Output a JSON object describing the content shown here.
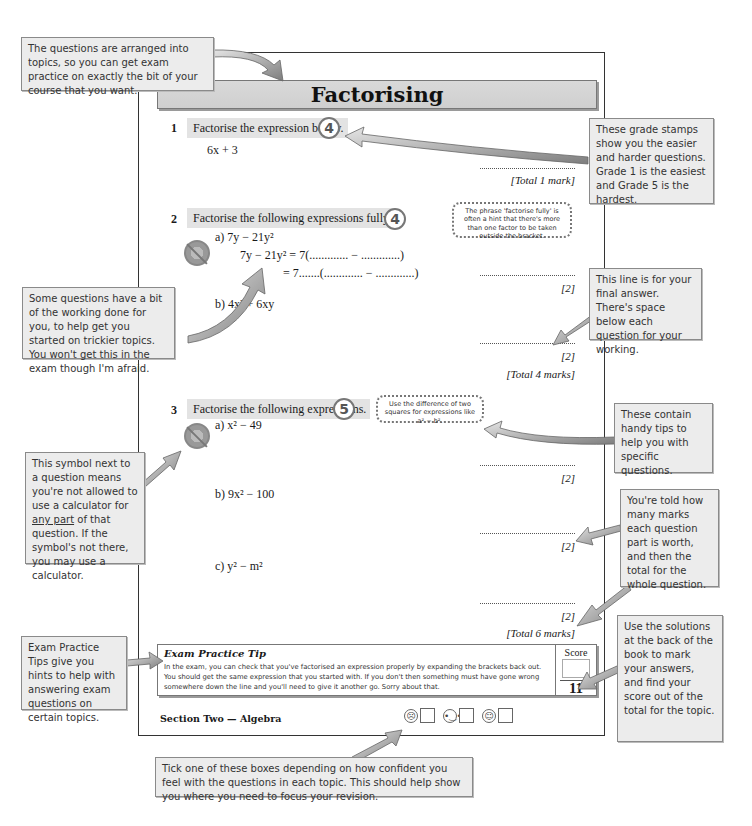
{
  "page": {
    "title": "Factorising",
    "section_footer": "Section Two — Algebra"
  },
  "questions": [
    {
      "number": "1",
      "text": "Factorise the expression below.",
      "grade": "4",
      "parts": [
        {
          "expr": "6x + 3"
        }
      ],
      "total": "[Total 1 mark]"
    },
    {
      "number": "2",
      "text": "Factorise the following expressions fully.",
      "grade": "4",
      "tip": "The phrase 'factorise fully' is often a hint that there's more than one factor to be taken outside the bracket.",
      "parts": [
        {
          "label": "a)",
          "expr": "7y − 21y²",
          "working_line1": "7y − 21y² = 7(............. − .............)",
          "working_line2": "= 7.......(............. − .............)",
          "mark": "[2]"
        },
        {
          "label": "b)",
          "expr": "4x² + 6xy",
          "mark": "[2]"
        }
      ],
      "total": "[Total 4 marks]"
    },
    {
      "number": "3",
      "text": "Factorise the following expressions.",
      "grade": "5",
      "tip": "Use the difference of two squares for expressions like a² − b².",
      "parts": [
        {
          "label": "a)",
          "expr": "x² − 49",
          "mark": "[2]"
        },
        {
          "label": "b)",
          "expr": "9x² − 100",
          "mark": "[2]"
        },
        {
          "label": "c)",
          "expr": "y² − m²",
          "mark": "[2]"
        }
      ],
      "total": "[Total 6 marks]"
    }
  ],
  "exam_tip": {
    "title": "Exam Practice Tip",
    "body": "In the exam, you can check that you've factorised an expression properly by expanding the brackets back out. You should get the same expression that you started with. If you don't then something must have gone wrong somewhere down the line and you'll need to give it another go. Sorry about that.",
    "score_label": "Score",
    "score_total": "11"
  },
  "confidence": [
    {
      "face": "sad",
      "glyph": "☹"
    },
    {
      "face": "neutral",
      "glyph": "😐"
    },
    {
      "face": "happy",
      "glyph": "☺"
    }
  ],
  "callouts": {
    "topics": "The questions are arranged into topics, so you can get exam practice on exactly the bit of your course that you want.",
    "grade_stamps": "These grade stamps show you the easier and harder questions. Grade 1 is the easiest and Grade 5 is the hardest.",
    "working": "Some questions have a bit of the working done for you, to help get you started on trickier topics. You won't get this in the exam though I'm afraid.",
    "final_line": "This line is for your final answer. There's space below each question for your working.",
    "calculator_pre": "This symbol next to a question means you're not allowed to use a calculator for ",
    "calculator_underlined": "any part",
    "calculator_post": " of that question. If the symbol's not there, you may use a calculator.",
    "tips": "These contain handy tips to help you with specific questions.",
    "marks": "You're told how many marks each question part is worth, and then the total for the whole question.",
    "exam_tips": "Exam Practice Tips give you hints to help with answering exam questions on certain topics.",
    "solutions": "Use the solutions at the back of the book to mark your answers, and find your score out of the total for the topic.",
    "confidence": "Tick one of these boxes depending on how confident you feel with the questions in each topic. This should help show you where you need to focus your revision."
  }
}
